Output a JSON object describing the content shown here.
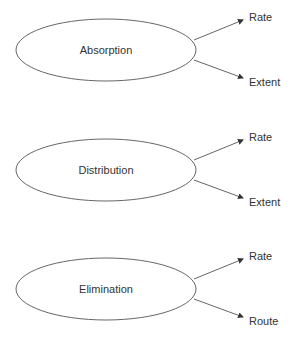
{
  "diagram": {
    "nodes": [
      {
        "label": "Absorption",
        "offset_y": 0,
        "branches": [
          "Rate",
          "Extent"
        ]
      },
      {
        "label": "Distribution",
        "offset_y": 120,
        "branches": [
          "Rate",
          "Extent"
        ]
      },
      {
        "label": "Elimination",
        "offset_y": 239,
        "branches": [
          "Rate",
          "Route"
        ]
      }
    ],
    "colors": {
      "stroke": "#555555",
      "text": "#333333",
      "background": "#ffffff"
    }
  }
}
